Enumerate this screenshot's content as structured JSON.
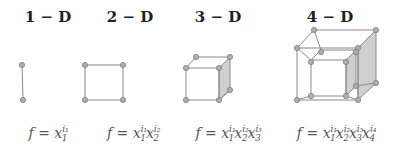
{
  "figure": {
    "panels": [
      {
        "title": "1 − D",
        "x": 22,
        "f_lhs": "f = ",
        "terms": [
          {
            "base": "x",
            "sub": "1",
            "sup": "i₁"
          }
        ]
      },
      {
        "title": "2 − D",
        "x": 104,
        "f_lhs": "f = ",
        "terms": [
          {
            "base": "x",
            "sub": "1",
            "sup": "i₁"
          },
          {
            "base": "x",
            "sub": "2",
            "sup": "i₂"
          }
        ]
      },
      {
        "title": "3 − D",
        "x": 208,
        "f_lhs": "f = ",
        "terms": [
          {
            "base": "x",
            "sub": "1",
            "sup": "i₁"
          },
          {
            "base": "x",
            "sub": "2",
            "sup": "i₂"
          },
          {
            "base": "x",
            "sub": "3",
            "sup": "i₃"
          }
        ]
      },
      {
        "title": "4 − D",
        "x": 334,
        "f_lhs": "f = ",
        "terms": [
          {
            "base": "x",
            "sub": "1",
            "sup": "i₁"
          },
          {
            "base": "x",
            "sub": "2",
            "sup": "i₂"
          },
          {
            "base": "x",
            "sub": "3",
            "sup": "i₃"
          },
          {
            "base": "x",
            "sub": "4",
            "sup": "i₄"
          }
        ]
      }
    ],
    "colors": {
      "edge": "#8a8a8a",
      "node_fill": "#b0b0b0",
      "node_stroke": "#7a7a7a",
      "shade": "#cfcfcf"
    }
  }
}
